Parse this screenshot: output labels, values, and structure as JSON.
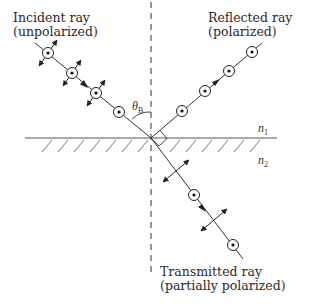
{
  "diagram": {
    "labels": {
      "incident_line1": "Incident ray",
      "incident_line2": "(unpolarized)",
      "reflected_line1": "Reflected ray",
      "reflected_line2": "(polarized)",
      "transmitted_line1": "Transmitted ray",
      "transmitted_line2": "(partially polarized)"
    },
    "symbols": {
      "angle": "θ",
      "angle_subscript": "B",
      "medium1": "n",
      "medium1_subscript": "1",
      "medium2": "n",
      "medium2_subscript": "2"
    },
    "elements": {
      "interface": "horizontal boundary line between medium n1 (top) and medium n2 (hatched, bottom)",
      "normal": "vertical dashed normal line",
      "incident_ray": "unpolarized: circles with dots and double-headed arrows perpendicular to ray",
      "reflected_ray": "polarized: circles with dots only",
      "transmitted_ray": "partially polarized: alternating double arrows and dotted circles",
      "right_angle_marker": "90° between reflected and transmitted rays"
    },
    "colors": {
      "ink": "#333333",
      "background": "#ffffff"
    }
  }
}
